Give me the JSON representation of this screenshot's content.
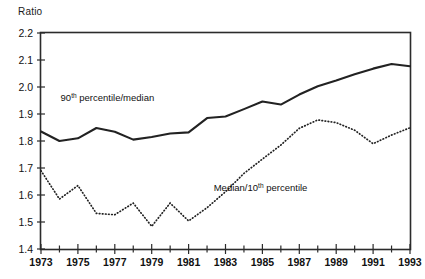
{
  "axis_title": "Ratio",
  "chart_data": {
    "type": "line",
    "title": "",
    "xlabel": "",
    "ylabel": "Ratio",
    "ylim": [
      1.4,
      2.2
    ],
    "xlim": [
      1973,
      1993
    ],
    "ytick_labels": [
      "2.2",
      "2.1",
      "2.0",
      "1.9",
      "1.8",
      "1.7",
      "1.6",
      "1.5",
      "1.4"
    ],
    "ytick_values": [
      2.2,
      2.1,
      2.0,
      1.9,
      1.8,
      1.7,
      1.6,
      1.5,
      1.4
    ],
    "xtick_labels": [
      "1973",
      "1975",
      "1977",
      "1979",
      "1981",
      "1983",
      "1985",
      "1987",
      "1989",
      "1991",
      "1993"
    ],
    "xtick_values": [
      1973,
      1975,
      1977,
      1979,
      1981,
      1983,
      1985,
      1987,
      1989,
      1991,
      1993
    ],
    "minor_xticks": [
      1974,
      1976,
      1978,
      1980,
      1982,
      1984,
      1986,
      1988,
      1990,
      1992
    ],
    "grid": false,
    "legend_position": "inline-annotations",
    "x": [
      1973,
      1974,
      1975,
      1976,
      1977,
      1978,
      1979,
      1980,
      1981,
      1982,
      1983,
      1984,
      1985,
      1986,
      1987,
      1988,
      1989,
      1990,
      1991,
      1992,
      1993
    ],
    "series": [
      {
        "name": "90th percentile/median",
        "label_plain": "90th percentile/median",
        "label_prefix": "90",
        "label_sup": "th",
        "label_suffix": " percentile/median",
        "style": "solid",
        "color": "#222222",
        "values": [
          1.835,
          1.8,
          1.81,
          1.848,
          1.834,
          1.805,
          1.815,
          1.828,
          1.832,
          1.885,
          1.891,
          1.918,
          1.946,
          1.935,
          1.972,
          2.003,
          2.024,
          2.047,
          2.068,
          2.085,
          2.077
        ]
      },
      {
        "name": "Median/10th percentile",
        "label_plain": "Median/10th percentile",
        "label_prefix": "Median/10",
        "label_sup": "th",
        "label_suffix": " percentile",
        "style": "dotted",
        "color": "#222222",
        "values": [
          1.69,
          1.585,
          1.635,
          1.532,
          1.527,
          1.57,
          1.484,
          1.57,
          1.504,
          1.553,
          1.612,
          1.68,
          1.733,
          1.785,
          1.847,
          1.878,
          1.868,
          1.84,
          1.79,
          1.822,
          1.849
        ]
      }
    ],
    "annotations": [
      {
        "text": "90th percentile/median",
        "x": 1976.6,
        "y": 1.947
      },
      {
        "text": "Median/10th percentile",
        "x": 1984.9,
        "y": 1.615
      }
    ]
  }
}
